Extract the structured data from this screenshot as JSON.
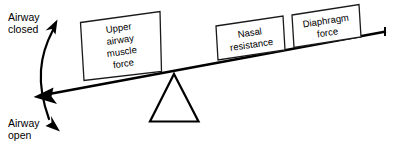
{
  "diagram": {
    "axis_labels": {
      "top": {
        "line1": "Airway",
        "line2": "closed"
      },
      "bottom": {
        "line1": "Airway",
        "line2": "open"
      }
    },
    "blocks": [
      {
        "name": "upper-airway-muscle-force",
        "lines": [
          "Upper",
          "airway",
          "muscle",
          "force"
        ]
      },
      {
        "name": "nasal-resistance",
        "lines": [
          "Nasal",
          "resistance"
        ]
      },
      {
        "name": "diaphragm-force",
        "lines": [
          "Diaphragm",
          "force"
        ]
      }
    ],
    "icons": {
      "fulcrum": "triangle-icon",
      "beam": "beam-icon",
      "rotation_arrow": "curved-double-arrow-icon",
      "beam_arrow": "left-arrowhead-icon"
    },
    "colors": {
      "stroke": "#000000",
      "background": "#ffffff",
      "box_fill": "#ffffff"
    }
  }
}
